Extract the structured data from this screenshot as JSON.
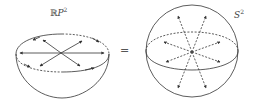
{
  "left_figure": {
    "label_prefix": "ℝ",
    "label_main": "P",
    "label_sup": "2",
    "description": "hemisphere with antipodal rim points identified"
  },
  "equals_sign": "=",
  "right_figure": {
    "label_main": "S",
    "label_sup": "2",
    "description": "sphere with antipodal arrows from center"
  },
  "colors": {
    "stroke": "#333333",
    "background": "#ffffff"
  }
}
